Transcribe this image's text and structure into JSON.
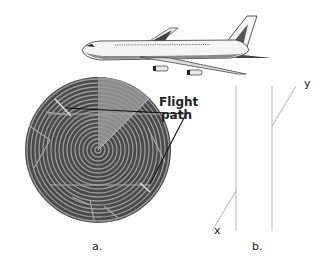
{
  "figure": {
    "annotation": {
      "line1": "Flight",
      "line2": "path"
    },
    "panels": {
      "a": "a.",
      "b": "b."
    },
    "axes": {
      "x": "x",
      "y": "y"
    }
  },
  "colors": {
    "radar_disc": "#4a4a4a",
    "radar_rings": "#9a9a9a",
    "radar_sweep": "#8c8c8c",
    "flight_path": "#111111",
    "plot_lines": "#bdbdbd",
    "aircraft_body": "#f4f4f4",
    "aircraft_shade": "#8a8a8a"
  },
  "icons": {
    "aircraft": "airplane-illustration",
    "radar": "radar-scope-illustration"
  }
}
